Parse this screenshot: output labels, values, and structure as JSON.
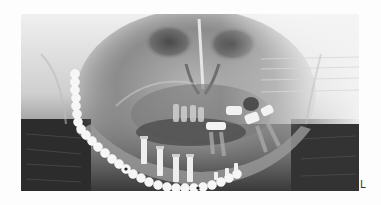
{
  "image": {
    "description": "Dental panoramic radiograph showing mandibular reconstruction plate with screws and dental implants",
    "modality": "Panoramic X-ray",
    "side_marker": "L"
  },
  "colors": {
    "background": "#fdfdfd",
    "bone_light": "#e8e8e8",
    "soft_tissue_dark": "#2a2a2a",
    "metal_plate": "#f4f4f4"
  },
  "annotations": {
    "reconstruction_plate": "Titanium reconstruction plate along right mandible",
    "implants_count": 4,
    "side_marker": "L"
  }
}
